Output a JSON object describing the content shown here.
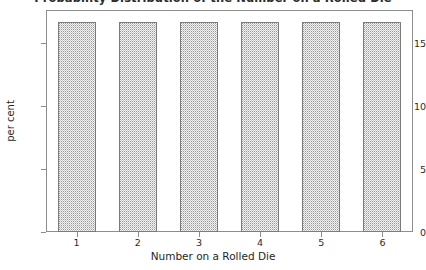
{
  "chart_data": {
    "type": "bar",
    "title": "Probability Distribution of the Number on a Rolled Die",
    "xlabel": "Number on a Rolled Die",
    "ylabel": "per cent",
    "categories": [
      "1",
      "2",
      "3",
      "4",
      "5",
      "6"
    ],
    "values": [
      16.67,
      16.67,
      16.67,
      16.67,
      16.67,
      16.67
    ],
    "ylim": [
      0,
      17.6
    ],
    "yticks": [
      0,
      5,
      10,
      15
    ],
    "ytick_labels": [
      "0",
      "5",
      "10",
      "15"
    ],
    "xtick_labels": [
      "1",
      "2",
      "3",
      "4",
      "5",
      "6"
    ],
    "grid": false,
    "legend": null,
    "bar_fill": "#f2f2f2",
    "bar_pattern": "stipple-dots",
    "bar_edge_color": "#7b7b7b",
    "axis_color": "#8d8d8d",
    "background": "#ffffff"
  }
}
